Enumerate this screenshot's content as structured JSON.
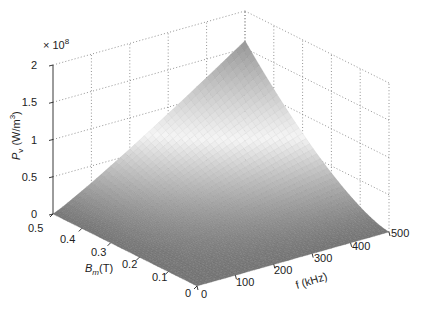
{
  "chart_data": {
    "type": "surface",
    "title": "",
    "exponent_label": "× 10",
    "exponent_power": "8",
    "xlabel": "f (kHz)",
    "ylabel": "B_m(T)",
    "ylabel_main": "B",
    "ylabel_sub": "m",
    "ylabel_unit": "(T)",
    "zlabel": "P_v (W/m^3)",
    "zlabel_main": "P",
    "zlabel_sub": "v",
    "zlabel_unit": " (W/m",
    "zlabel_sup": "3",
    "zlabel_close": ")",
    "x_ticks": [
      "0",
      "100",
      "200",
      "300",
      "400",
      "500"
    ],
    "y_ticks": [
      "0",
      "0.1",
      "0.2",
      "0.3",
      "0.4",
      "0.5"
    ],
    "z_ticks": [
      "0",
      "0.5",
      "1",
      "1.5",
      "2"
    ],
    "xlim": [
      0,
      500
    ],
    "ylim": [
      0,
      0.5
    ],
    "zlim": [
      0,
      2
    ],
    "z_scale": 100000000,
    "grid": true,
    "colormap": "gray",
    "surface_description": "P_v increases with both f and B_m; maximum ≈ 1.6×10^8 W/m^3 at f = 500 kHz, B_m = 0.5 T; zero along f = 0 and B_m = 0",
    "sample_points": [
      {
        "f": 0,
        "B": 0.5,
        "P": 0
      },
      {
        "f": 500,
        "B": 0,
        "P": 0
      },
      {
        "f": 0,
        "B": 0,
        "P": 0
      },
      {
        "f": 500,
        "B": 0.5,
        "P": 1.6
      },
      {
        "f": 250,
        "B": 0.5,
        "P": 0.75
      },
      {
        "f": 500,
        "B": 0.25,
        "P": 0.55
      }
    ],
    "model": {
      "k": 1.6,
      "f_exp": 1.1,
      "B_exp": 1.5
    }
  }
}
